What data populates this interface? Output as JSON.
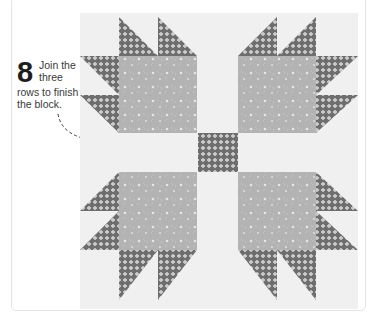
{
  "instruction": {
    "step_number": "8",
    "line1": "Join the",
    "line2": "three",
    "line3": "rows to finish",
    "line4": "the block."
  },
  "quilt_block": {
    "name": "Bear's Paw",
    "colors": {
      "background": "#f0f0f0",
      "paw_print": "#b3b3b3",
      "claw_print": "#6e6e6e",
      "print_dots": "#ffffff",
      "frame": "#e4e4e4"
    }
  }
}
